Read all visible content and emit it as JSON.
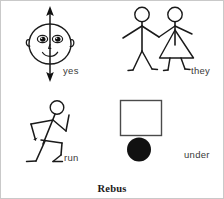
{
  "figure": {
    "caption": "Rebus",
    "background_color": "#ffffff",
    "ink_color": "#1a1a1a",
    "label_color": "#3a3a3a",
    "border_color": "#c9c9c9"
  },
  "panels": [
    {
      "id": "yes",
      "label": "yes",
      "icon_name": "nodding-face-with-vertical-double-arrow",
      "description": "Smiley face with ears and a vertical double-headed arrow through it"
    },
    {
      "id": "they",
      "label": "they",
      "icon_name": "two-stick-figures-holding-hands",
      "description": "A male stick figure and a female stick figure with a triangular skirt holding hands"
    },
    {
      "id": "run",
      "label": "run",
      "icon_name": "running-stick-figure",
      "description": "Stick figure in a running pose with bent arms and legs"
    },
    {
      "id": "under",
      "label": "under",
      "icon_name": "square-above-filled-circle",
      "description": "An open square with a solid black circle beneath it"
    }
  ]
}
